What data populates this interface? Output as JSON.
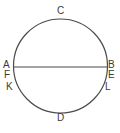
{
  "figure": {
    "name": "circle-with-horizontal-diameter-and-point-labels",
    "background_color": "#ffffff",
    "stroke_color": "#4a4a4a",
    "label_color": "#3b3b3b",
    "circle": {
      "center_x": 60.5,
      "center_y": 66,
      "radius": 47,
      "stroke_width": 1.2
    },
    "chord": {
      "name": "horizontal-diameter",
      "x1": 13.5,
      "y1": 67,
      "x2": 107.5,
      "y2": 67,
      "stroke_width": 1.2
    },
    "labels": [
      {
        "id": "C",
        "text": "C",
        "x": 57,
        "y": 6,
        "position": "top"
      },
      {
        "id": "A",
        "text": "A",
        "x": 3,
        "y": 60,
        "position": "left-diameter-end"
      },
      {
        "id": "B",
        "text": "B",
        "x": 108,
        "y": 60,
        "position": "right-diameter-end"
      },
      {
        "id": "F",
        "text": "F",
        "x": 4,
        "y": 70,
        "position": "left-below-A"
      },
      {
        "id": "E",
        "text": "E",
        "x": 108,
        "y": 70,
        "position": "right-below-B"
      },
      {
        "id": "K",
        "text": "K",
        "x": 6,
        "y": 82,
        "position": "lower-left"
      },
      {
        "id": "L",
        "text": "L",
        "x": 105,
        "y": 82,
        "position": "lower-right"
      },
      {
        "id": "D",
        "text": "D",
        "x": 57,
        "y": 113,
        "position": "bottom"
      }
    ]
  }
}
